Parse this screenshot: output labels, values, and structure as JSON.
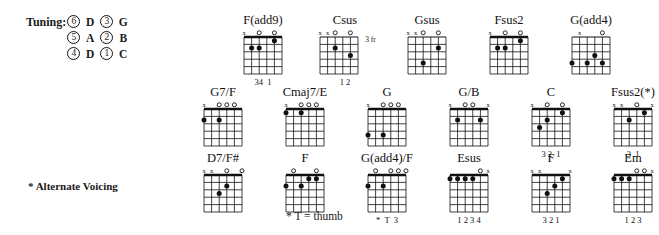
{
  "tuning": {
    "label": "Tuning:",
    "rows": [
      {
        "left_string": "6",
        "left_note": "D",
        "right_string": "3",
        "right_note": "G"
      },
      {
        "left_string": "5",
        "left_note": "A",
        "right_string": "2",
        "right_note": "B"
      },
      {
        "left_string": "4",
        "left_note": "D",
        "right_string": "1",
        "right_note": "C"
      }
    ]
  },
  "footnotes": {
    "alternate_voicing": "* Alternate Voicing",
    "thumb": "* T = thumb"
  },
  "chart_style": {
    "strings": 6,
    "frets": 5,
    "dot_color": "#111111",
    "line_color": "#111111"
  },
  "chord_rows": [
    [
      {
        "name": "F(add9)",
        "open_marks": [
          "x",
          "",
          "o",
          "",
          "o",
          ""
        ],
        "dots": [
          {
            "string": 5,
            "fret": 2
          },
          {
            "string": 4,
            "fret": 2
          },
          {
            "string": 2,
            "fret": 1
          }
        ],
        "fingering": "34  1",
        "fret_label": "",
        "nut": true
      },
      {
        "name": "Csus",
        "open_marks": [
          "x",
          "x",
          "o",
          "",
          "o",
          ""
        ],
        "dots": [
          {
            "string": 4,
            "fret": 2
          },
          {
            "string": 2,
            "fret": 3
          }
        ],
        "fingering": "1 2",
        "fret_label": "3 fr",
        "nut": false
      },
      {
        "name": "Gsus",
        "open_marks": [
          "x",
          "x",
          "o",
          "",
          "o",
          ""
        ],
        "dots": [
          {
            "string": 2,
            "fret": 2
          },
          {
            "string": 4,
            "fret": 4
          }
        ],
        "fingering": "",
        "fret_label": "",
        "nut": false
      },
      {
        "name": "Fsus2",
        "open_marks": [
          "x",
          "",
          "o",
          "",
          "o",
          ""
        ],
        "dots": [
          {
            "string": 5,
            "fret": 2
          },
          {
            "string": 4,
            "fret": 2
          },
          {
            "string": 2,
            "fret": 1
          }
        ],
        "fingering": "",
        "fret_label": "",
        "nut": true
      },
      {
        "name": "G(add4)",
        "open_marks": [
          "",
          "x",
          "",
          "",
          "o",
          ""
        ],
        "dots": [
          {
            "string": 6,
            "fret": 4
          },
          {
            "string": 4,
            "fret": 4
          },
          {
            "string": 3,
            "fret": 3
          },
          {
            "string": 2,
            "fret": 4
          }
        ],
        "fingering": "",
        "fret_label": "",
        "nut": false
      }
    ],
    [
      {
        "name": "G7/F",
        "open_marks": [
          "x",
          "",
          "o",
          "o",
          "o",
          ""
        ],
        "dots": [
          {
            "string": 6,
            "fret": 2
          },
          {
            "string": 4,
            "fret": 2
          }
        ],
        "fingering": "",
        "fret_label": "",
        "nut": true
      },
      {
        "name": "Cmaj7/E",
        "open_marks": [
          "x",
          "",
          "o",
          "o",
          "o",
          ""
        ],
        "dots": [
          {
            "string": 6,
            "fret": 1
          },
          {
            "string": 4,
            "fret": 1
          }
        ],
        "fingering": "",
        "fret_label": "",
        "nut": true
      },
      {
        "name": "G",
        "open_marks": [
          "x",
          "",
          "o",
          "o",
          "o",
          ""
        ],
        "dots": [
          {
            "string": 6,
            "fret": 4
          },
          {
            "string": 4,
            "fret": 4
          }
        ],
        "fingering": "",
        "fret_label": "",
        "nut": true
      },
      {
        "name": "G/B",
        "open_marks": [
          "x",
          "",
          "o",
          "o",
          "",
          "x"
        ],
        "dots": [
          {
            "string": 5,
            "fret": 2
          },
          {
            "string": 2,
            "fret": 2
          }
        ],
        "fingering": "",
        "fret_label": "",
        "nut": true
      },
      {
        "name": "C",
        "open_marks": [
          "x",
          "",
          "o",
          "",
          "o",
          ""
        ],
        "dots": [
          {
            "string": 5,
            "fret": 3
          },
          {
            "string": 4,
            "fret": 2
          },
          {
            "string": 2,
            "fret": 1
          }
        ],
        "fingering": "3 2  1",
        "fret_label": "",
        "nut": true
      },
      {
        "name": "Fsus2(*)",
        "open_marks": [
          "x",
          "x",
          "",
          "o",
          "",
          "x"
        ],
        "dots": [
          {
            "string": 4,
            "fret": 2
          },
          {
            "string": 2,
            "fret": 1
          }
        ],
        "fingering": "3  1",
        "fret_label": "",
        "nut": true
      }
    ],
    [
      {
        "name": "D7/F#",
        "open_marks": [
          "x",
          "x",
          "",
          "o",
          "",
          "o"
        ],
        "dots": [
          {
            "string": 3,
            "fret": 2
          },
          {
            "string": 4,
            "fret": 3
          }
        ],
        "fingering": "",
        "fret_label": "",
        "nut": true
      },
      {
        "name": "F",
        "open_marks": [
          "",
          "o",
          "",
          "",
          "o",
          ""
        ],
        "dots": [
          {
            "string": 6,
            "fret": 2
          },
          {
            "string": 4,
            "fret": 2
          },
          {
            "string": 3,
            "fret": 1
          },
          {
            "string": 2,
            "fret": 1
          }
        ],
        "fingering": "",
        "fret_label": "",
        "nut": true
      },
      {
        "name": "G(add4)/F",
        "open_marks": [
          "",
          "o",
          "",
          "o",
          "o",
          "o"
        ],
        "dots": [
          {
            "string": 6,
            "fret": 2
          },
          {
            "string": 4,
            "fret": 2
          }
        ],
        "fingering": "*  T  3",
        "fret_label": "",
        "nut": true
      },
      {
        "name": "Esus",
        "open_marks": [
          "",
          "",
          "",
          "",
          "o",
          "x"
        ],
        "dots": [
          {
            "string": 6,
            "fret": 1
          },
          {
            "string": 5,
            "fret": 1
          },
          {
            "string": 4,
            "fret": 1
          },
          {
            "string": 3,
            "fret": 1
          }
        ],
        "fingering": "1 2 3 4",
        "fret_label": "",
        "nut": true
      },
      {
        "name": "F",
        "open_marks": [
          "x",
          "x",
          "",
          "",
          "",
          "x"
        ],
        "dots": [
          {
            "string": 4,
            "fret": 3
          },
          {
            "string": 3,
            "fret": 2
          },
          {
            "string": 2,
            "fret": 1
          }
        ],
        "fingering": "3 2 1",
        "fret_label": "",
        "nut": true
      },
      {
        "name": "Em",
        "open_marks": [
          "",
          "",
          "",
          "o",
          "o",
          "x"
        ],
        "dots": [
          {
            "string": 6,
            "fret": 1
          },
          {
            "string": 5,
            "fret": 1
          },
          {
            "string": 4,
            "fret": 1
          }
        ],
        "fingering": "1 2 3",
        "fret_label": "",
        "nut": true
      }
    ]
  ]
}
